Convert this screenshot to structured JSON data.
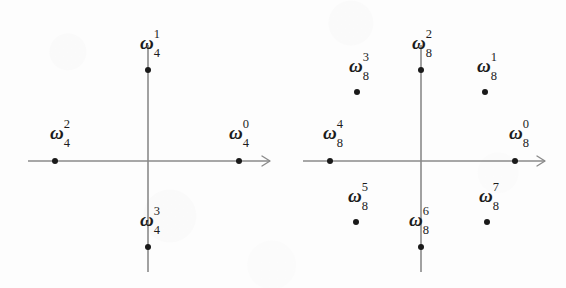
{
  "figure": {
    "background_color": "#fdfdfd",
    "ink_color": "#1a1a1a",
    "axis_color": "#8a8a8a",
    "width": 566,
    "height": 288
  },
  "chart_data": {
    "type": "scatter",
    "xlabel": "",
    "ylabel": "",
    "grid": false,
    "legend": "none",
    "panels": [
      {
        "name": "fourth-roots-of-unity",
        "n": 4,
        "center": {
          "x": 148,
          "y": 161
        },
        "radius": 91,
        "x_axis": {
          "start_x": 28,
          "end_x": 270,
          "y": 161,
          "arrow": "right"
        },
        "y_axis": {
          "x": 148,
          "start_y": 45,
          "end_y": 272,
          "arrow": "none"
        },
        "points": [
          {
            "id": "w4_0",
            "base": "ω",
            "sup": "0",
            "sub": "4",
            "angle_deg": 0,
            "x": 239,
            "y": 161,
            "label_x": 239,
            "label_y": 135
          },
          {
            "id": "w4_1",
            "base": "ω",
            "sup": "1",
            "sub": "4",
            "angle_deg": 90,
            "x": 148,
            "y": 70,
            "label_x": 150,
            "label_y": 45
          },
          {
            "id": "w4_2",
            "base": "ω",
            "sup": "2",
            "sub": "4",
            "angle_deg": 180,
            "x": 55,
            "y": 161,
            "label_x": 60,
            "label_y": 135
          },
          {
            "id": "w4_3",
            "base": "ω",
            "sup": "3",
            "sub": "4",
            "angle_deg": 270,
            "x": 148,
            "y": 247,
            "label_x": 150,
            "label_y": 222
          }
        ]
      },
      {
        "name": "eighth-roots-of-unity",
        "n": 8,
        "center": {
          "x": 421,
          "y": 161
        },
        "radius": 93,
        "x_axis": {
          "start_x": 303,
          "end_x": 545,
          "y": 161,
          "arrow": "right"
        },
        "y_axis": {
          "x": 421,
          "start_y": 45,
          "end_y": 272,
          "arrow": "none"
        },
        "points": [
          {
            "id": "w8_0",
            "base": "ω",
            "sup": "0",
            "sub": "8",
            "angle_deg": 0,
            "x": 515,
            "y": 161,
            "label_x": 519,
            "label_y": 135
          },
          {
            "id": "w8_1",
            "base": "ω",
            "sup": "1",
            "sub": "8",
            "angle_deg": 45,
            "x": 485,
            "y": 92,
            "label_x": 487,
            "label_y": 68
          },
          {
            "id": "w8_2",
            "base": "ω",
            "sup": "2",
            "sub": "8",
            "angle_deg": 90,
            "x": 421,
            "y": 70,
            "label_x": 422,
            "label_y": 45
          },
          {
            "id": "w8_3",
            "base": "ω",
            "sup": "3",
            "sub": "8",
            "angle_deg": 135,
            "x": 357,
            "y": 92,
            "label_x": 359,
            "label_y": 68
          },
          {
            "id": "w8_4",
            "base": "ω",
            "sup": "4",
            "sub": "8",
            "angle_deg": 180,
            "x": 330,
            "y": 161,
            "label_x": 333,
            "label_y": 135
          },
          {
            "id": "w8_5",
            "base": "ω",
            "sup": "5",
            "sub": "8",
            "angle_deg": 225,
            "x": 356,
            "y": 222,
            "label_x": 358,
            "label_y": 198
          },
          {
            "id": "w8_6",
            "base": "ω",
            "sup": "6",
            "sub": "8",
            "angle_deg": 270,
            "x": 421,
            "y": 247,
            "label_x": 419,
            "label_y": 222
          },
          {
            "id": "w8_7",
            "base": "ω",
            "sup": "7",
            "sub": "8",
            "angle_deg": 315,
            "x": 487,
            "y": 222,
            "label_x": 489,
            "label_y": 198
          }
        ]
      }
    ]
  }
}
